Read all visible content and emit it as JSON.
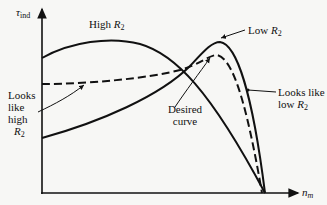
{
  "figure": {
    "y_axis": {
      "symbol": "τ",
      "subscript": "ind"
    },
    "x_axis": {
      "symbol": "n",
      "subscript": "m"
    },
    "curves": [
      {
        "id": "high-r2",
        "label": "High",
        "var": "R",
        "sub": "2",
        "style": "solid"
      },
      {
        "id": "low-r2",
        "label": "Low",
        "var": "R",
        "sub": "2",
        "style": "solid"
      },
      {
        "id": "desired",
        "label_line1": "Desired",
        "label_line2": "curve",
        "style": "dashed"
      }
    ],
    "annotations": {
      "looks_like_high": {
        "line1": "Looks",
        "line2": "like",
        "line3": "high",
        "var": "R",
        "sub": "2"
      },
      "looks_like_low": {
        "line1": "Looks like",
        "line2_prefix": "low",
        "var": "R",
        "sub": "2"
      }
    },
    "colors": {
      "ink": "#111111",
      "background": "#f7f7f5"
    }
  }
}
